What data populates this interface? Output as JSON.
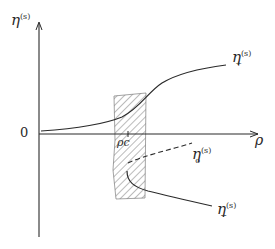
{
  "diagram": {
    "y_axis_label": {
      "base": "η",
      "sup": "(s)"
    },
    "x_axis_label": "ρ",
    "origin_label": "0",
    "critical_label": "ρc",
    "curves": [
      {
        "name": "eta-plus",
        "base": "η",
        "sup": "(s)",
        "sub": "+",
        "style": "solid"
      },
      {
        "name": "eta-zero",
        "base": "η",
        "sup": "(s)",
        "sub": "o",
        "style": "dashed"
      },
      {
        "name": "eta-minus",
        "base": "η",
        "sup": "(s)",
        "sub": "−",
        "style": "solid"
      }
    ],
    "colors": {
      "ink": "#2a2a2a",
      "background": "#ffffff"
    }
  }
}
